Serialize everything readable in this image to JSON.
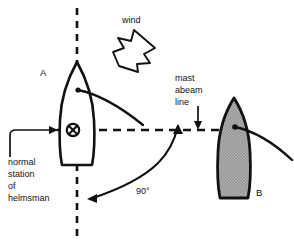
{
  "diagram": {
    "colors": {
      "ink": "#111111",
      "boat_b_fill": "#a8a8a8",
      "background": "#ffffff"
    },
    "labels": {
      "wind": "wind",
      "boat_a": "A",
      "boat_b": "B",
      "mast_abeam_line_1": "mast",
      "mast_abeam_line_2": "abeam",
      "mast_abeam_line_3": "line",
      "helmsman_1": "normal",
      "helmsman_2": "station",
      "helmsman_3": "of",
      "helmsman_4": "helmsman",
      "angle": "90°"
    },
    "icons": {
      "wind_arrow": "wind-arrow-icon",
      "helmsman_marker": "circled-x-icon",
      "mast_abeam_pointer": "down-arrow-icon",
      "angle_arc": "angle-arc-icon",
      "leader": "leader-line-icon"
    },
    "elements": {
      "boat_a_name": "sailboat-a-outline",
      "boat_b_name": "sailboat-b-shaded",
      "centerline_name": "vertical-dashed-centreline",
      "abeam_line_name": "horizontal-dashed-mast-abeam-line"
    }
  }
}
